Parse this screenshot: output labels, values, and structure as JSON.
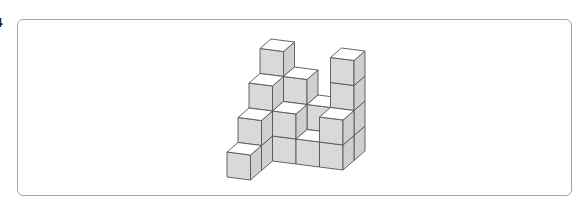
{
  "question": {
    "number_fragment": "4"
  },
  "figure": {
    "colors": {
      "top_face": "#ffffff",
      "front_face": "#d9d9d9",
      "side_face": "#cfcfcf",
      "edge": "#555555",
      "frame_border": "#a6a6a6"
    },
    "projection": {
      "origin": [
        227,
        177
      ],
      "ex": [
        23.5,
        3
      ],
      "ez": [
        11,
        -9.5
      ],
      "ey": [
        0,
        -25
      ]
    },
    "cubes": [
      [
        0,
        3,
        0
      ],
      [
        1,
        3,
        0
      ],
      [
        2,
        3,
        0
      ],
      [
        3,
        3,
        0
      ],
      [
        0,
        3,
        1
      ],
      [
        1,
        3,
        1
      ],
      [
        2,
        3,
        1
      ],
      [
        3,
        3,
        1
      ],
      [
        0,
        3,
        2
      ],
      [
        1,
        3,
        2
      ],
      [
        3,
        3,
        2
      ],
      [
        0,
        3,
        3
      ],
      [
        3,
        3,
        3
      ],
      [
        0,
        2,
        0
      ],
      [
        1,
        2,
        0
      ],
      [
        2,
        2,
        0
      ],
      [
        3,
        2,
        0
      ],
      [
        0,
        2,
        1
      ],
      [
        1,
        2,
        1
      ],
      [
        3,
        2,
        1
      ],
      [
        0,
        2,
        2
      ],
      [
        0,
        1,
        0
      ],
      [
        0,
        1,
        1
      ],
      [
        0,
        0,
        0
      ]
    ]
  }
}
